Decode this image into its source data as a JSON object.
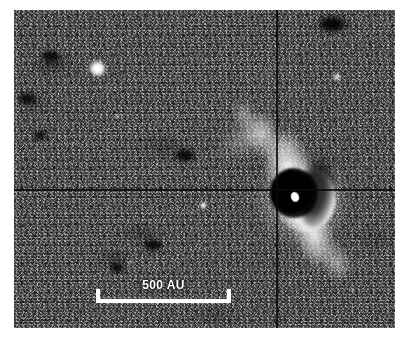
{
  "figure": {
    "kind": "astronomical-image",
    "modality": "grayscale near-infrared scattered-light image",
    "background_color": "#ffffff",
    "frame": {
      "x": 14,
      "y": 10,
      "width": 381,
      "height": 318,
      "sky_color": "#3d3d3d"
    }
  },
  "annotations": {
    "scalebar": {
      "label": "500 AU",
      "value": 500,
      "unit": "AU",
      "color": "#ffffff",
      "x": 96,
      "y": 289,
      "length_px": 135
    }
  },
  "overlays": {
    "crosshair_horizontal": {
      "y": 179,
      "color": "#0a0a0a"
    },
    "crosshair_vertical": {
      "x": 262,
      "color": "#0a0a0a"
    }
  },
  "features": [
    {
      "name": "central-source",
      "label": "central star / disk",
      "x": 281,
      "y": 187
    },
    {
      "name": "dark-disk-lane",
      "label": "dark edge-on dust lane",
      "x": 280,
      "y": 183
    },
    {
      "name": "north-lobe",
      "label": "northwest reflection lobe",
      "x": 250,
      "y": 130
    },
    {
      "name": "south-lobe",
      "label": "southeast reflection lobe",
      "x": 312,
      "y": 245
    }
  ],
  "stars": [
    {
      "name": "field-star-bright-nw",
      "x": 97,
      "y": 68,
      "size": 17,
      "brightness": 1.0
    },
    {
      "name": "field-star-ne",
      "x": 337,
      "y": 77,
      "size": 8,
      "brightness": 0.7
    },
    {
      "name": "field-star-faint-w",
      "x": 117,
      "y": 116,
      "size": 5,
      "brightness": 0.55
    },
    {
      "name": "field-star-center-s",
      "x": 203,
      "y": 205,
      "size": 7,
      "brightness": 0.92
    },
    {
      "name": "field-star-sw",
      "x": 131,
      "y": 262,
      "size": 4,
      "brightness": 0.45
    },
    {
      "name": "field-star-se",
      "x": 352,
      "y": 290,
      "size": 4,
      "brightness": 0.48
    },
    {
      "name": "field-star-nnw",
      "x": 68,
      "y": 186,
      "size": 3,
      "brightness": 0.4
    },
    {
      "name": "field-star-ene",
      "x": 366,
      "y": 163,
      "size": 3,
      "brightness": 0.38
    }
  ],
  "dark_blobs": [
    {
      "name": "dark-patch-nne",
      "x": 332,
      "y": 24,
      "w": 26,
      "h": 16
    },
    {
      "name": "dark-patch-nw",
      "x": 51,
      "y": 56,
      "w": 20,
      "h": 12
    },
    {
      "name": "dark-patch-w",
      "x": 27,
      "y": 98,
      "w": 18,
      "h": 11
    },
    {
      "name": "dark-patch-cw",
      "x": 40,
      "y": 135,
      "w": 14,
      "h": 9
    },
    {
      "name": "dark-patch-mid",
      "x": 185,
      "y": 155,
      "w": 22,
      "h": 13
    },
    {
      "name": "dark-patch-sw",
      "x": 153,
      "y": 245,
      "w": 20,
      "h": 12
    },
    {
      "name": "dark-patch-ssw",
      "x": 117,
      "y": 268,
      "w": 16,
      "h": 10
    }
  ]
}
